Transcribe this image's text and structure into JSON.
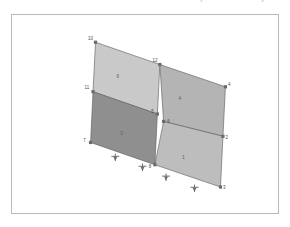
{
  "top_strip": {
    "clipped_text": "Finite element shell mesh — isometric view of panel assembly"
  },
  "viewport": {
    "name": "model-viewport",
    "background_color": "#ffffff",
    "border_color": "#b9b9b9"
  },
  "model": {
    "title": "2x2 shell element panel mesh",
    "projection": "isometric",
    "edge_color": "#5e5e5e",
    "node_marker_color": "#6b6b6b",
    "support_color": "#6e6e6e",
    "elements": [
      {
        "id": "9",
        "label": "9",
        "fill": "#c9c9c9",
        "label_x": 78,
        "label_y": 51
      },
      {
        "id": "4",
        "label": "4",
        "fill": "#b4b4b4",
        "label_x": 128,
        "label_y": 69
      },
      {
        "id": "3",
        "label": "3",
        "fill": "#8f8f8f",
        "label_x": 81,
        "label_y": 97
      },
      {
        "id": "1",
        "label": "1",
        "fill": "#bdbdbd",
        "label_x": 131,
        "label_y": 116
      }
    ],
    "nodes": [
      {
        "id": "10",
        "label": "10",
        "x": 60,
        "y": 22,
        "label_dx": -4,
        "label_dy": -2
      },
      {
        "id": "12",
        "label": "12",
        "x": 112,
        "y": 40,
        "label_dx": -4,
        "label_dy": -2
      },
      {
        "id": "4",
        "label": "4",
        "x": 165,
        "y": 58,
        "label_dx": 3,
        "label_dy": -1
      },
      {
        "id": "11",
        "label": "11",
        "x": 58,
        "y": 62,
        "label_dx": -5,
        "label_dy": -2
      },
      {
        "id": "5",
        "label": "5",
        "x": 110,
        "y": 80,
        "label_dx": -4,
        "label_dy": -1
      },
      {
        "id": "6",
        "label": "6",
        "x": 115,
        "y": 86,
        "label_dx": 4,
        "label_dy": 1
      },
      {
        "id": "2",
        "label": "2",
        "x": 163,
        "y": 98,
        "label_dx": 3,
        "label_dy": 2
      },
      {
        "id": "7",
        "label": "7",
        "x": 56,
        "y": 103,
        "label_dx": -5,
        "label_dy": 0
      },
      {
        "id": "8",
        "label": "8",
        "x": 108,
        "y": 121,
        "label_dx": -4,
        "label_dy": 3
      },
      {
        "id": "3",
        "label": "3",
        "x": 161,
        "y": 139,
        "label_dx": 3,
        "label_dy": 2
      }
    ],
    "supports": [
      {
        "id": "support-1",
        "type": "pin",
        "x": 76,
        "y": 112
      },
      {
        "id": "support-2",
        "type": "pin",
        "x": 98,
        "y": 120
      },
      {
        "id": "support-3",
        "type": "pin",
        "x": 117,
        "y": 128
      },
      {
        "id": "support-4",
        "type": "pin",
        "x": 140,
        "y": 137
      }
    ]
  }
}
